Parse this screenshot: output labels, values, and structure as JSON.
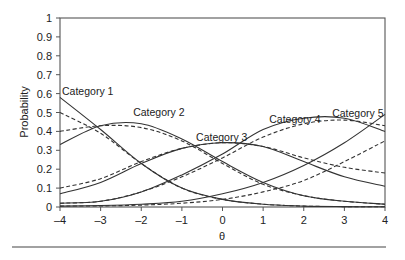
{
  "chart_data": {
    "type": "line",
    "title": "",
    "xlabel": "θ",
    "ylabel": "Probability",
    "xlim": [
      -4,
      4
    ],
    "ylim": [
      0,
      1
    ],
    "grid": false,
    "legend_position": "none (inline category labels)",
    "x_ticks": [
      "–4",
      "–3",
      "–2",
      "–1",
      "0",
      "1",
      "2",
      "3",
      "4"
    ],
    "y_ticks": [
      "0",
      "0.1",
      "0.2",
      "0.3",
      "0.4",
      "0.5",
      "0.6",
      "0.7",
      "0.8",
      "0.9",
      "1"
    ],
    "x": [
      -4,
      -3,
      -2,
      -1,
      0,
      1,
      2,
      3,
      4
    ],
    "annotations": [
      {
        "text": "Category 1",
        "x": -3.95,
        "y": 0.59
      },
      {
        "text": "Category 2",
        "x": -2.2,
        "y": 0.48
      },
      {
        "text": "Category 3",
        "x": -0.65,
        "y": 0.35
      },
      {
        "text": "Category 4",
        "x": 1.15,
        "y": 0.445
      },
      {
        "text": "Category 5",
        "x": 2.7,
        "y": 0.475
      }
    ],
    "series": [
      {
        "name": "Category 1 (solid)",
        "style": "solid",
        "values": [
          0.58,
          0.41,
          0.23,
          0.1,
          0.04,
          0.015,
          0.005,
          0.002,
          0.001
        ]
      },
      {
        "name": "Category 2 (solid)",
        "style": "solid",
        "values": [
          0.33,
          0.43,
          0.44,
          0.36,
          0.24,
          0.13,
          0.06,
          0.03,
          0.015
        ]
      },
      {
        "name": "Category 3 (solid)",
        "style": "solid",
        "values": [
          0.07,
          0.13,
          0.23,
          0.31,
          0.34,
          0.32,
          0.24,
          0.16,
          0.11
        ]
      },
      {
        "name": "Category 4 (solid)",
        "style": "solid",
        "values": [
          0.02,
          0.03,
          0.08,
          0.17,
          0.28,
          0.41,
          0.47,
          0.47,
          0.4
        ]
      },
      {
        "name": "Category 5 (solid)",
        "style": "solid",
        "values": [
          0.005,
          0.008,
          0.015,
          0.03,
          0.07,
          0.13,
          0.22,
          0.34,
          0.49
        ]
      },
      {
        "name": "Category 1 (dashed)",
        "style": "dashed",
        "values": [
          0.5,
          0.39,
          0.23,
          0.1,
          0.04,
          0.015,
          0.005,
          0.002,
          0.001
        ]
      },
      {
        "name": "Category 2 (dashed)",
        "style": "dashed",
        "values": [
          0.4,
          0.43,
          0.42,
          0.35,
          0.23,
          0.12,
          0.06,
          0.03,
          0.015
        ]
      },
      {
        "name": "Category 3 (dashed)",
        "style": "dashed",
        "values": [
          0.1,
          0.15,
          0.24,
          0.31,
          0.34,
          0.32,
          0.26,
          0.21,
          0.18
        ]
      },
      {
        "name": "Category 4 (dashed)",
        "style": "dashed",
        "values": [
          0.02,
          0.03,
          0.08,
          0.16,
          0.26,
          0.37,
          0.44,
          0.46,
          0.43
        ]
      },
      {
        "name": "Category 5 (dashed)",
        "style": "dashed",
        "values": [
          0.005,
          0.006,
          0.01,
          0.02,
          0.04,
          0.08,
          0.14,
          0.24,
          0.35
        ]
      }
    ]
  },
  "colors": {
    "line": "#333333",
    "axis": "#555555",
    "rule": "#444444"
  }
}
